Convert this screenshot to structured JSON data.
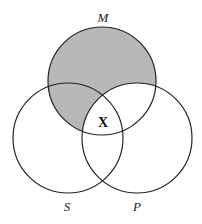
{
  "diagram": {
    "type": "venn-3-set",
    "sets": [
      {
        "id": "M",
        "label": "M"
      },
      {
        "id": "S",
        "label": "S"
      },
      {
        "id": "P",
        "label": "P"
      }
    ],
    "shaded_region": "M minus P",
    "marked_region": {
      "region": "M ∩ S ∩ P",
      "label": "X"
    },
    "colors": {
      "shade": "#b8b8b8",
      "stroke": "#222222",
      "background": "#ffffff"
    }
  }
}
